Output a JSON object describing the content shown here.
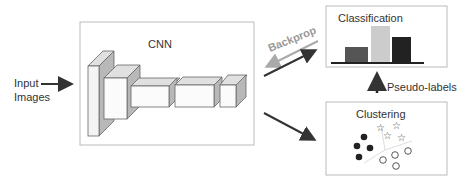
{
  "input": {
    "label_line1": "Input",
    "label_line2": "Images"
  },
  "cnn": {
    "title": "CNN"
  },
  "classification": {
    "title": "Classification",
    "bars": [
      {
        "name": "bar-1",
        "color": "#555555",
        "height": 16
      },
      {
        "name": "bar-2",
        "color": "#cccccc",
        "height": 37
      },
      {
        "name": "bar-3",
        "color": "#222222",
        "height": 26
      }
    ]
  },
  "clustering": {
    "title": "Clustering"
  },
  "arrows": {
    "backprop": "Backprop",
    "pseudo_labels": "Pseudo-labels"
  },
  "colors": {
    "box_border": "#bbbbbb",
    "arrow_dark": "#333333",
    "arrow_light": "#aaaaaa",
    "side_shade": "#b8b8b8"
  }
}
